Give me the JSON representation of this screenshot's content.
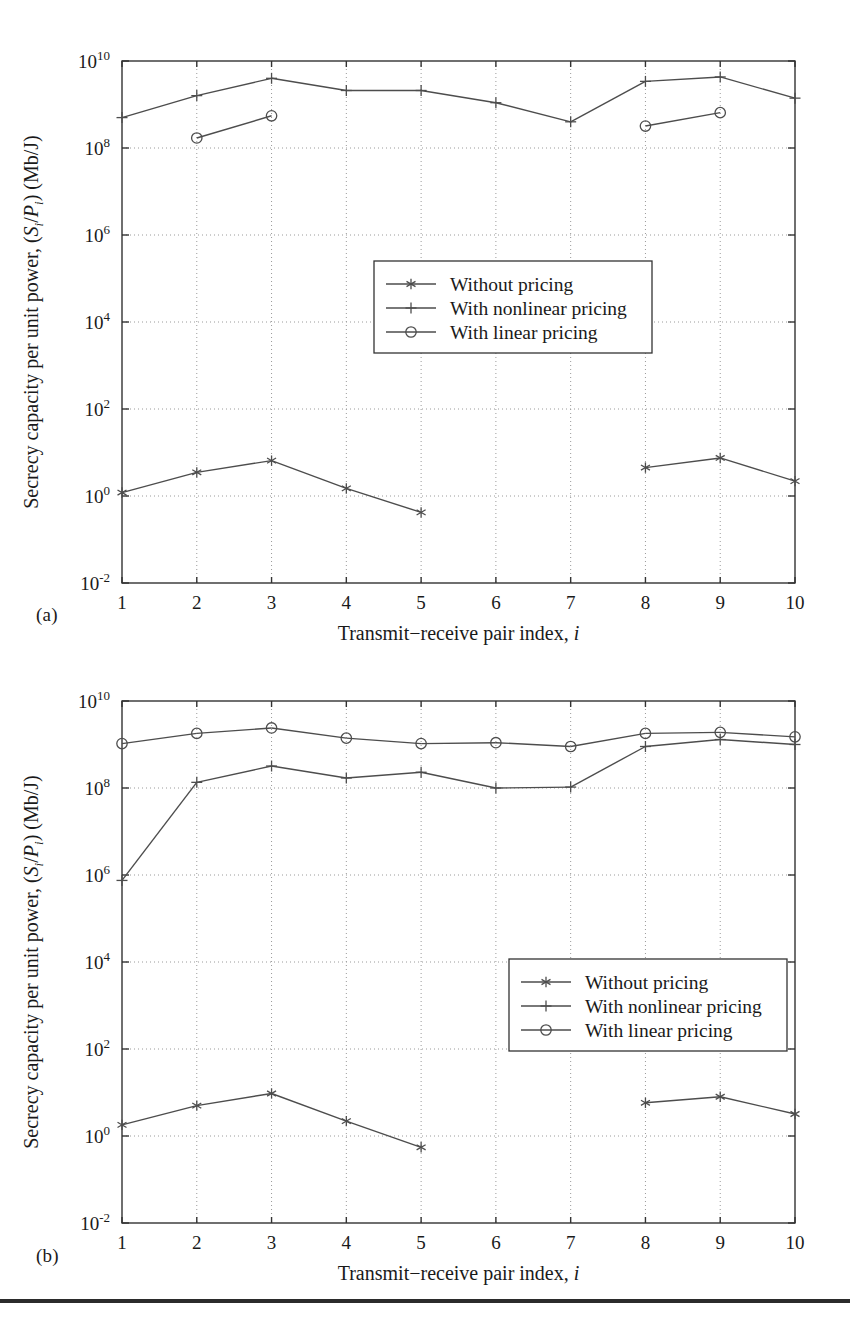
{
  "figure": {
    "panels": [
      {
        "key": "a",
        "label": "(a)"
      },
      {
        "key": "b",
        "label": "(b)"
      }
    ],
    "rule_color": "#2b2b2b"
  },
  "axes": {
    "x_title_parts": {
      "main": "Transmit−receive pair index,",
      "symbol": "i"
    },
    "y_title_parts": {
      "p1": "Secrecy capacity per unit power, (",
      "s": "S",
      "sub1": "i",
      "slash": "/",
      "p": "P",
      "sub2": "i",
      "p2": ") (Mb/J)"
    },
    "x_ticks": [
      "1",
      "2",
      "3",
      "4",
      "5",
      "6",
      "7",
      "8",
      "9",
      "10"
    ],
    "y_tick_mantissa": "10",
    "y_tick_exponents": [
      "-2",
      "0",
      "2",
      "4",
      "6",
      "8",
      "10"
    ],
    "x_range": [
      1,
      10
    ],
    "y_log_range": [
      -2,
      10
    ],
    "grid": "dotted"
  },
  "legend": {
    "position_a": "center",
    "position_b": "lower-right",
    "entries": [
      {
        "label": "Without pricing",
        "marker": "asterisk",
        "marker_name": "asterisk-marker"
      },
      {
        "label": "With nonlinear pricing",
        "marker": "plus",
        "marker_name": "plus-marker"
      },
      {
        "label": "With linear pricing",
        "marker": "circle",
        "marker_name": "circle-marker"
      }
    ]
  },
  "colors": {
    "line": "#4d4d4d",
    "axis": "#333333",
    "grid": "#9a9a9a",
    "text": "#1a1a1a"
  },
  "chart_data": [
    {
      "type": "line",
      "panel": "(a)",
      "title": "",
      "xlabel": "Transmit−receive pair index, i",
      "ylabel": "Secrecy capacity per unit power, (S_i/P_i) (Mb/J)",
      "yscale": "log",
      "xlim": [
        1,
        10
      ],
      "ylim": [
        0.01,
        10000000000.0
      ],
      "x": [
        1,
        2,
        3,
        4,
        5,
        6,
        7,
        8,
        9,
        10
      ],
      "grid": true,
      "legend_position": "center",
      "series": [
        {
          "name": "Without pricing",
          "marker": "asterisk",
          "x": [
            1,
            2,
            3,
            4,
            5,
            8,
            9,
            10
          ],
          "values": [
            1.2,
            3.5,
            6.5,
            1.5,
            0.42,
            4.5,
            7.5,
            2.2
          ],
          "gaps": [
            [
              5,
              8
            ]
          ]
        },
        {
          "name": "With nonlinear pricing",
          "marker": "plus",
          "x": [
            1,
            2,
            3,
            4,
            5,
            6,
            7,
            8,
            9,
            10
          ],
          "values": [
            500000000.0,
            1600000000.0,
            4000000000.0,
            2100000000.0,
            2100000000.0,
            1100000000.0,
            400000000.0,
            3400000000.0,
            4300000000.0,
            1400000000.0
          ],
          "gaps": []
        },
        {
          "name": "With linear pricing",
          "marker": "circle",
          "x": [
            2,
            3,
            8,
            9
          ],
          "values": [
            170000000.0,
            550000000.0,
            320000000.0,
            650000000.0
          ],
          "gaps": [
            [
              3,
              8
            ]
          ]
        }
      ]
    },
    {
      "type": "line",
      "panel": "(b)",
      "title": "",
      "xlabel": "Transmit−receive pair index, i",
      "ylabel": "Secrecy capacity per unit power, (S_i/P_i) (Mb/J)",
      "yscale": "log",
      "xlim": [
        1,
        10
      ],
      "ylim": [
        0.01,
        10000000000.0
      ],
      "x": [
        1,
        2,
        3,
        4,
        5,
        6,
        7,
        8,
        9,
        10
      ],
      "grid": true,
      "legend_position": "lower-right",
      "series": [
        {
          "name": "Without pricing",
          "marker": "asterisk",
          "x": [
            1,
            2,
            3,
            4,
            5,
            8,
            9,
            10
          ],
          "values": [
            1.8,
            5.0,
            9.5,
            2.2,
            0.55,
            5.8,
            8.0,
            3.2
          ],
          "gaps": [
            [
              5,
              8
            ]
          ]
        },
        {
          "name": "With nonlinear pricing",
          "marker": "plus",
          "x": [
            1,
            2,
            3,
            4,
            5,
            6,
            7,
            8,
            9,
            10
          ],
          "values": [
            750000.0,
            135000000.0,
            320000000.0,
            170000000.0,
            230000000.0,
            100000000.0,
            105000000.0,
            900000000.0,
            1300000000.0,
            1000000000.0
          ],
          "gaps": []
        },
        {
          "name": "With linear pricing",
          "marker": "circle",
          "x": [
            1,
            2,
            3,
            4,
            5,
            6,
            7,
            8,
            9,
            10
          ],
          "values": [
            1050000000.0,
            1800000000.0,
            2400000000.0,
            1400000000.0,
            1050000000.0,
            1100000000.0,
            900000000.0,
            1800000000.0,
            1900000000.0,
            1500000000.0
          ],
          "gaps": []
        }
      ]
    }
  ]
}
